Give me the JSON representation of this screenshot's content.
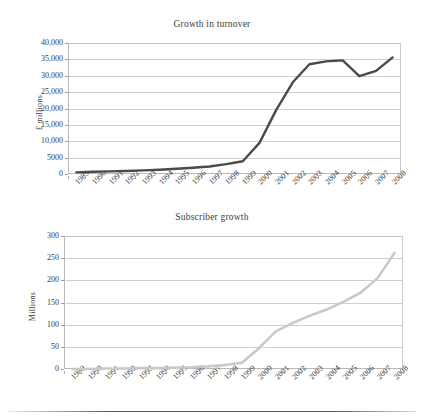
{
  "document": {
    "footer_rule": "horizontal-rule"
  },
  "charts": [
    {
      "id": "chart1",
      "title": "Growth in turnover",
      "ylabel": "£ millions",
      "ytick_labels": [
        "40,000",
        "35,000",
        "30,000",
        "25,000",
        "20,000",
        "15,000",
        "10,000",
        "5000",
        "0"
      ],
      "xtick_labels": [
        "1989",
        "1990",
        "1991",
        "1992",
        "1993",
        "1994",
        "1995",
        "1996",
        "1997",
        "1998",
        "1999",
        "2000",
        "2001",
        "2002",
        "2003",
        "2004",
        "2005",
        "2006",
        "2007",
        "2008"
      ],
      "line_color": "#4a4a4a"
    },
    {
      "id": "chart2",
      "title": "Subscriber growth",
      "ylabel": "Millions",
      "ytick_labels": [
        "300",
        "250",
        "200",
        "150",
        "100",
        "50",
        "0"
      ],
      "xtick_labels": [
        "1989",
        "1990",
        "1991",
        "1992",
        "1993",
        "1994",
        "1995",
        "1996",
        "1997",
        "1998",
        "1999",
        "2000",
        "2001",
        "2002",
        "2003",
        "2004",
        "2005",
        "2006",
        "2007",
        "2008"
      ],
      "line_color": "#c9c9c9"
    }
  ],
  "chart_data": [
    {
      "type": "line",
      "title": "Growth in turnover",
      "xlabel": "",
      "ylabel": "£ millions",
      "ylim": [
        0,
        40000
      ],
      "yticks": [
        0,
        5000,
        10000,
        15000,
        20000,
        25000,
        30000,
        35000,
        40000
      ],
      "grid": true,
      "legend": "none",
      "categories": [
        "1989",
        "1990",
        "1991",
        "1992",
        "1993",
        "1994",
        "1995",
        "1996",
        "1997",
        "1998",
        "1999",
        "2000",
        "2001",
        "2002",
        "2003",
        "2004",
        "2005",
        "2006",
        "2007",
        "2008"
      ],
      "series": [
        {
          "name": "Turnover",
          "values": [
            500,
            700,
            800,
            900,
            1100,
            1300,
            1600,
            1900,
            2300,
            3000,
            3900,
            9500,
            19500,
            28000,
            33500,
            34400,
            34700,
            29900,
            31500,
            35600
          ]
        }
      ]
    },
    {
      "type": "line",
      "title": "Subscriber growth",
      "xlabel": "",
      "ylabel": "Millions",
      "ylim": [
        0,
        300
      ],
      "yticks": [
        0,
        50,
        100,
        150,
        200,
        250,
        300
      ],
      "grid": true,
      "legend": "none",
      "categories": [
        "1989",
        "1990",
        "1991",
        "1992",
        "1993",
        "1994",
        "1995",
        "1996",
        "1997",
        "1998",
        "1999",
        "2000",
        "2001",
        "2002",
        "2003",
        "2004",
        "2005",
        "2006",
        "2007",
        "2008"
      ],
      "series": [
        {
          "name": "Subscribers",
          "values": [
            0,
            0,
            1,
            1,
            2,
            2,
            3,
            4,
            6,
            9,
            14,
            47,
            85,
            104,
            120,
            134,
            152,
            172,
            205,
            262
          ]
        }
      ]
    }
  ]
}
